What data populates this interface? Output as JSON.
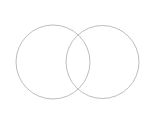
{
  "diagram": {
    "type": "venn",
    "width": 148,
    "height": 121,
    "background": "#ffffff",
    "stroke_color": "#bdbdbd",
    "stroke_width": 1,
    "circles": [
      {
        "name": "left-circle",
        "cx": 53,
        "cy": 62,
        "r": 37
      },
      {
        "name": "right-circle",
        "cx": 102.5,
        "cy": 62,
        "r": 36.5
      }
    ]
  }
}
